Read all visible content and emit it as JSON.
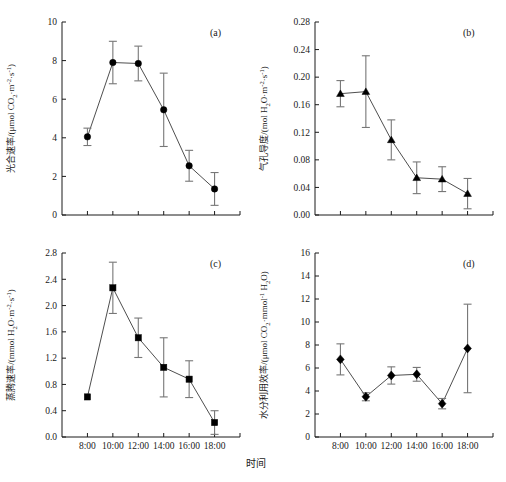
{
  "figure": {
    "xaxis_title": "时间",
    "background": "#ffffff",
    "marker_color": "#000000",
    "line_color": "#3a3a3a",
    "errorbar_color": "#777777",
    "caption_partial": ""
  },
  "chart_data": [
    {
      "type": "line",
      "panel": "(a)",
      "title": "",
      "xlabel": "时间",
      "ylabel": "光合速率/(μmol CO₂·m⁻²·s⁻¹)",
      "ylabel_parts": {
        "lead": "光合速率/(μmol CO",
        "sub1": "2",
        "mid": "·m",
        "sup1": "-2",
        "mid2": "·s",
        "sup2": "-1",
        "tail": ")"
      },
      "categories": [
        "8:00",
        "10:00",
        "12:00",
        "14:00",
        "16:00",
        "18:00"
      ],
      "values": [
        4.05,
        7.9,
        7.85,
        5.45,
        2.55,
        1.35
      ],
      "errors": [
        0.45,
        1.1,
        0.9,
        1.9,
        0.8,
        0.85
      ],
      "ylim": [
        0,
        10
      ],
      "yticks": [
        0,
        2,
        4,
        6,
        8,
        10
      ],
      "ytick_labels": [
        "0",
        "2",
        "4",
        "6",
        "8",
        "10"
      ],
      "marker": "circle",
      "grid": false,
      "legend": "none"
    },
    {
      "type": "line",
      "panel": "(b)",
      "title": "",
      "xlabel": "时间",
      "ylabel": "气孔导度/(mol H₂O·m⁻²·s⁻¹)",
      "ylabel_parts": {
        "lead": "气孔导度/(mol H",
        "sub1": "2",
        "mid": "O·m",
        "sup1": "-2",
        "mid2": "·s",
        "sup2": "-1",
        "tail": ")"
      },
      "categories": [
        "8:00",
        "10:00",
        "12:00",
        "14:00",
        "16:00",
        "18:00"
      ],
      "values": [
        0.176,
        0.179,
        0.109,
        0.054,
        0.052,
        0.031
      ],
      "errors": [
        0.019,
        0.052,
        0.029,
        0.023,
        0.018,
        0.022
      ],
      "ylim": [
        0,
        0.28
      ],
      "yticks": [
        0,
        0.04,
        0.08,
        0.12,
        0.16,
        0.2,
        0.24,
        0.28
      ],
      "ytick_labels": [
        "0.00",
        "0.04",
        "0.08",
        "0.12",
        "0.16",
        "0.20",
        "0.24",
        "0.28"
      ],
      "marker": "triangle",
      "grid": false,
      "legend": "none"
    },
    {
      "type": "line",
      "panel": "(c)",
      "title": "",
      "xlabel": "时间",
      "ylabel": "蒸腾速率/(mmol H₂O·m⁻²·s⁻¹)",
      "ylabel_parts": {
        "lead": "蒸腾速率/(mmol H",
        "sub1": "2",
        "mid": "O·m",
        "sup1": "-2",
        "mid2": "·s",
        "sup2": "-1",
        "tail": ")"
      },
      "categories": [
        "8:00",
        "10:00",
        "12:00",
        "14:00",
        "16:00",
        "18:00"
      ],
      "values": [
        0.61,
        2.27,
        1.51,
        1.06,
        0.88,
        0.22
      ],
      "errors": [
        0.0,
        0.39,
        0.3,
        0.45,
        0.28,
        0.18
      ],
      "ylim": [
        0,
        2.8
      ],
      "yticks": [
        0,
        0.4,
        0.8,
        1.2,
        1.6,
        2.0,
        2.4,
        2.8
      ],
      "ytick_labels": [
        "0.0",
        "0.4",
        "0.8",
        "1.2",
        "1.6",
        "2.0",
        "2.4",
        "2.8"
      ],
      "marker": "square",
      "grid": false,
      "legend": "none"
    },
    {
      "type": "line",
      "panel": "(d)",
      "title": "",
      "xlabel": "时间",
      "ylabel": "水分利用效率/(μmol CO₂·mmol⁻¹ H₂O)",
      "ylabel_parts": {
        "lead": "水分利用效率/(μmol CO",
        "sub1": "2",
        "mid": "·mmol",
        "sup1": "-1",
        "mid2": " H",
        "sup2": "2",
        "tail": "O)"
      },
      "categories": [
        "8:00",
        "10:00",
        "12:00",
        "14:00",
        "16:00",
        "18:00"
      ],
      "values": [
        6.75,
        3.5,
        5.35,
        5.45,
        2.9,
        7.7
      ],
      "errors": [
        1.35,
        0.35,
        0.75,
        0.6,
        0.45,
        3.85
      ],
      "ylim": [
        0,
        16
      ],
      "yticks": [
        0,
        2,
        4,
        6,
        8,
        10,
        12,
        14,
        16
      ],
      "ytick_labels": [
        "0",
        "2",
        "4",
        "6",
        "8",
        "10",
        "12",
        "14",
        "16"
      ],
      "marker": "diamond",
      "grid": false,
      "legend": "none"
    }
  ]
}
